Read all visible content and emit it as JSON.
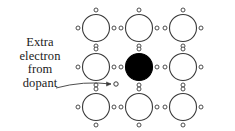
{
  "figure": {
    "title": "",
    "background_color": "#ffffff",
    "stroke_color": "#3a3a3a",
    "dopant_fill": "#000000",
    "atom_fill": "#ffffff",
    "width": 235,
    "height": 131
  },
  "annotation": {
    "lines": [
      "Extra",
      "electron",
      "from",
      "dopant"
    ],
    "line1": "Extra",
    "line2": "electron",
    "line3": "from",
    "line4": "dopant",
    "arrow": {
      "label": "pointer-arrow",
      "from_x": 56,
      "from_y": 88,
      "to_x": 111,
      "to_y": 84
    }
  },
  "lattice": {
    "rows": 3,
    "columns": 3,
    "atom_radius": 13.5,
    "electron_radius": 2.0,
    "spacing_x": 43.5,
    "spacing_y": 39.5,
    "origin_x": 96,
    "origin_y": 28,
    "atoms": [
      {
        "id": "atom-r1c1",
        "row": 1,
        "col": 1,
        "cx": 96,
        "cy": 28,
        "type": "host"
      },
      {
        "id": "atom-r1c2",
        "row": 1,
        "col": 2,
        "cx": 139,
        "cy": 28,
        "type": "host"
      },
      {
        "id": "atom-r1c3",
        "row": 1,
        "col": 3,
        "cx": 183,
        "cy": 28,
        "type": "host"
      },
      {
        "id": "atom-r2c1",
        "row": 2,
        "col": 1,
        "cx": 96,
        "cy": 67,
        "type": "host"
      },
      {
        "id": "atom-r2c2",
        "row": 2,
        "col": 2,
        "cx": 139,
        "cy": 67,
        "type": "dopant"
      },
      {
        "id": "atom-r2c3",
        "row": 2,
        "col": 3,
        "cx": 183,
        "cy": 67,
        "type": "host"
      },
      {
        "id": "atom-r3c1",
        "row": 3,
        "col": 1,
        "cx": 96,
        "cy": 107,
        "type": "host"
      },
      {
        "id": "atom-r3c2",
        "row": 3,
        "col": 2,
        "cx": 139,
        "cy": 107,
        "type": "host"
      },
      {
        "id": "atom-r3c3",
        "row": 3,
        "col": 3,
        "cx": 183,
        "cy": 107,
        "type": "host"
      }
    ],
    "extra_electron": {
      "id": "extra-electron",
      "cx": 116,
      "cy": 84,
      "r": 2.2
    }
  }
}
